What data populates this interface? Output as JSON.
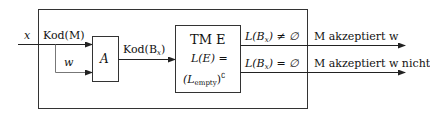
{
  "diagram": {
    "type": "reduction-block-diagram",
    "input": {
      "label": "x"
    },
    "input_parts": [
      {
        "id": "kod_m",
        "label": "Kod(M)"
      },
      {
        "id": "w",
        "label": "w"
      }
    ],
    "blocks": [
      {
        "id": "A",
        "label": "A"
      },
      {
        "id": "TM_E",
        "title": "TM E",
        "line2": "L(E) =",
        "line3_base": "(L",
        "line3_sub": "empty",
        "line3_close": ")",
        "line3_sup": "∁"
      }
    ],
    "edges": [
      {
        "from": "input",
        "to": "A",
        "label": "Kod(M)"
      },
      {
        "from": "input",
        "to": "A",
        "label": "w"
      },
      {
        "from": "A",
        "to": "TM_E",
        "label": "Kod(B_x)",
        "label_base": "Kod(B",
        "label_sub": "x",
        "label_close": ")"
      }
    ],
    "outputs": [
      {
        "condition": "L(B_x) ≠ ∅",
        "cond_base": "L(B",
        "cond_sub": "x",
        "cond_rest": ") ≠ ∅",
        "result": "M akzeptiert w"
      },
      {
        "condition": "L(B_x) = ∅",
        "cond_base": "L(B",
        "cond_sub": "x",
        "cond_rest": ") = ∅",
        "result": "M akzeptiert w nicht"
      }
    ],
    "colors": {
      "line": "#222222",
      "box_border": "#333333",
      "background": "#ffffff"
    }
  }
}
